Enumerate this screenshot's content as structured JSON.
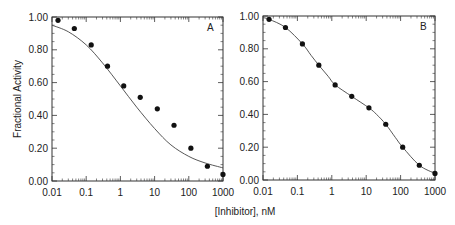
{
  "chart_data": [
    {
      "type": "scatter",
      "panel": "A",
      "title": "",
      "xlabel": "[Inhibitor], nM",
      "ylabel": "Fractional Activity",
      "xscale": "log",
      "xlim": [
        0.01,
        1000
      ],
      "ylim": [
        0.0,
        1.0
      ],
      "x_ticks": [
        "0.01",
        "0.1",
        "1",
        "10",
        "100",
        "1000"
      ],
      "y_ticks": [
        "0.00",
        "0.20",
        "0.40",
        "0.60",
        "0.80",
        "1.00"
      ],
      "grid": false,
      "series": [
        {
          "name": "data",
          "kind": "points",
          "x": [
            0.015,
            0.045,
            0.14,
            0.42,
            1.25,
            3.8,
            12,
            37,
            115,
            350,
            1000
          ],
          "y": [
            0.98,
            0.93,
            0.83,
            0.7,
            0.58,
            0.51,
            0.44,
            0.34,
            0.2,
            0.09,
            0.04
          ]
        },
        {
          "name": "fit",
          "kind": "line",
          "model": "single-site",
          "x": [
            0.01,
            0.03,
            0.1,
            0.3,
            1,
            3,
            10,
            30,
            100,
            300,
            1000
          ],
          "y": [
            0.95,
            0.91,
            0.83,
            0.72,
            0.58,
            0.45,
            0.32,
            0.22,
            0.15,
            0.11,
            0.08
          ]
        }
      ]
    },
    {
      "type": "scatter",
      "panel": "B",
      "title": "",
      "xlabel": "[Inhibitor], nM",
      "ylabel": "",
      "xscale": "log",
      "xlim": [
        0.01,
        1000
      ],
      "ylim": [
        0.0,
        1.0
      ],
      "x_ticks": [
        "0.01",
        "0.1",
        "1",
        "10",
        "100",
        "1000"
      ],
      "y_ticks": [
        "0.00",
        "0.20",
        "0.40",
        "0.60",
        "0.80",
        "1.00"
      ],
      "grid": false,
      "series": [
        {
          "name": "data",
          "kind": "points",
          "x": [
            0.015,
            0.045,
            0.14,
            0.42,
            1.25,
            3.8,
            12,
            37,
            115,
            350,
            1000
          ],
          "y": [
            0.98,
            0.93,
            0.83,
            0.7,
            0.58,
            0.51,
            0.44,
            0.34,
            0.2,
            0.09,
            0.04
          ]
        },
        {
          "name": "fit",
          "kind": "line",
          "model": "multi-site",
          "x": [
            0.01,
            0.015,
            0.045,
            0.14,
            0.25,
            0.42,
            0.8,
            1.25,
            3.8,
            12,
            20,
            37,
            70,
            115,
            350,
            1000
          ],
          "y": [
            0.99,
            0.98,
            0.93,
            0.83,
            0.76,
            0.7,
            0.63,
            0.58,
            0.51,
            0.44,
            0.4,
            0.34,
            0.26,
            0.2,
            0.09,
            0.04
          ]
        }
      ]
    }
  ],
  "labels": {
    "ylabel": "Fractional Activity",
    "xlabel": "[Inhibitor], nM",
    "panel_a": "A",
    "panel_b": "B"
  }
}
